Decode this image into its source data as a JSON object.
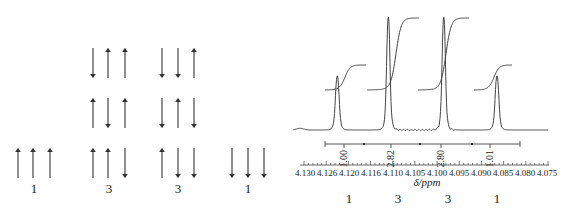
{
  "left_diagram": {
    "groups": [
      {
        "label": "1",
        "x": [
          18,
          33,
          50
        ],
        "rows": [
          {
            "y": 148,
            "spins": [
              "up",
              "up",
              "up"
            ]
          }
        ]
      },
      {
        "label": "3",
        "x": [
          93,
          108,
          125
        ],
        "rows": [
          {
            "y": 48,
            "spins": [
              "down",
              "up",
              "up"
            ]
          },
          {
            "y": 98,
            "spins": [
              "up",
              "down",
              "up"
            ]
          },
          {
            "y": 148,
            "spins": [
              "up",
              "up",
              "down"
            ]
          }
        ]
      },
      {
        "label": "3",
        "x": [
          162,
          178,
          194
        ],
        "rows": [
          {
            "y": 48,
            "spins": [
              "down",
              "down",
              "up"
            ]
          },
          {
            "y": 98,
            "spins": [
              "down",
              "up",
              "down"
            ]
          },
          {
            "y": 148,
            "spins": [
              "up",
              "down",
              "down"
            ]
          }
        ]
      },
      {
        "label": "1",
        "x": [
          232,
          248,
          264
        ],
        "rows": [
          {
            "y": 148,
            "spins": [
              "down",
              "down",
              "down"
            ]
          }
        ]
      }
    ],
    "label_x": [
      34,
      109,
      178,
      248
    ]
  },
  "spectrum": {
    "peaks": [
      {
        "center_ppm": 4.1225,
        "height": 0.48,
        "width": 0.0011
      },
      {
        "center_ppm": 4.111,
        "height": 1.0,
        "width": 0.001
      },
      {
        "center_ppm": 4.0985,
        "height": 1.0,
        "width": 0.001
      },
      {
        "center_ppm": 4.0865,
        "height": 0.48,
        "width": 0.0011
      }
    ],
    "integrals": [
      {
        "value": "1.00",
        "x_label": 344
      },
      {
        "value": "2.82",
        "x_label": 391
      },
      {
        "value": "2.80",
        "x_label": 441
      },
      {
        "value": "1.01",
        "x_label": 490
      }
    ],
    "integral_bar": {
      "x_start": 325,
      "x_end": 520,
      "dividers": [
        364,
        420,
        472
      ]
    },
    "axis": {
      "tick_labels": [
        "4.130",
        "4.126",
        "4.120",
        "4.116",
        "4.110",
        "4.105",
        "4.100",
        "4.095",
        "4.090",
        "4.085",
        "4.080",
        "4.075"
      ],
      "xlabel": "δ/ppm"
    },
    "multiplicities": [
      "1",
      "3",
      "3",
      "1"
    ]
  },
  "chart_data": {
    "type": "line",
    "title": "",
    "xlabel": "δ/ppm",
    "ylabel": "",
    "x_reversed": true,
    "xlim": [
      4.132,
      4.074
    ],
    "x_ticks": [
      "4.130",
      "4.126",
      "4.120",
      "4.116",
      "4.110",
      "4.105",
      "4.100",
      "4.095",
      "4.090",
      "4.085",
      "4.080",
      "4.075"
    ],
    "grid": false,
    "series": [
      {
        "name": "1H NMR quartet",
        "peaks_ppm": [
          4.1225,
          4.111,
          4.0985,
          4.0865
        ],
        "relative_heights": [
          0.48,
          1.0,
          1.0,
          0.48
        ]
      }
    ],
    "integrals": [
      1.0,
      2.82,
      2.8,
      1.01
    ],
    "multiplicity_ratio": [
      1,
      3,
      3,
      1
    ]
  }
}
